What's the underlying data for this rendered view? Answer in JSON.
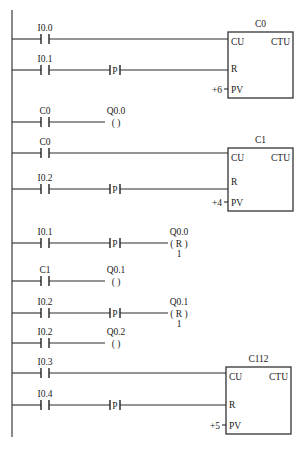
{
  "diagram": {
    "type": "plc-ladder-diagram",
    "left_rail": {
      "x": 12,
      "y_top": 10,
      "y_bottom": 437
    },
    "rungs": [
      {
        "id": "r1",
        "y": 39,
        "contact": "I0.0",
        "edge": null,
        "target": "C0.CU"
      },
      {
        "id": "r2",
        "y": 70,
        "contact": "I0.1",
        "edge": "P",
        "target": "C0.R"
      },
      {
        "id": "r3",
        "y": 122,
        "contact": "C0",
        "edge": null,
        "coil": {
          "label": "Q0.0",
          "type": "( )",
          "n": ""
        }
      },
      {
        "id": "r4",
        "y": 153,
        "contact": "C0",
        "edge": null,
        "target": "C1.CU"
      },
      {
        "id": "r5",
        "y": 189,
        "contact": "I0.2",
        "edge": "P",
        "target": "C1.R"
      },
      {
        "id": "r6",
        "y": 243,
        "contact": "I0.1",
        "edge": "P",
        "coil": {
          "label": "Q0.0",
          "type": "( R )",
          "n": "1"
        }
      },
      {
        "id": "r7",
        "y": 281,
        "contact": "C1",
        "edge": null,
        "coil": {
          "label": "Q0.1",
          "type": "( )",
          "n": ""
        }
      },
      {
        "id": "r8",
        "y": 313,
        "contact": "I0.2",
        "edge": "P",
        "coil": {
          "label": "Q0.1",
          "type": "( R )",
          "n": "1"
        }
      },
      {
        "id": "r9",
        "y": 343,
        "contact": "I0.2",
        "edge": null,
        "coil": {
          "label": "Q0.2",
          "type": "( )",
          "n": ""
        }
      },
      {
        "id": "r10",
        "y": 373,
        "contact": "I0.3",
        "edge": null,
        "target": "C112.CU"
      },
      {
        "id": "r11",
        "y": 405,
        "contact": "I0.4",
        "edge": "P",
        "target": "C112.R"
      }
    ],
    "counters": [
      {
        "name": "C0",
        "type": "CTU",
        "pins": [
          "CU",
          "R",
          "PV"
        ],
        "pv": "+6",
        "box": {
          "x": 228,
          "y": 32,
          "w": 65,
          "h": 66
        }
      },
      {
        "name": "C1",
        "type": "CTU",
        "pins": [
          "CU",
          "R",
          "PV"
        ],
        "pv": "+4",
        "box": {
          "x": 228,
          "y": 148,
          "w": 65,
          "h": 63
        }
      },
      {
        "name": "C112",
        "type": "CTU",
        "pins": [
          "CU",
          "R",
          "PV"
        ],
        "pv": "+5",
        "box": {
          "x": 226,
          "y": 367,
          "w": 65,
          "h": 67
        }
      }
    ],
    "edge_label": "P",
    "caption": "图 … 梯形图"
  }
}
